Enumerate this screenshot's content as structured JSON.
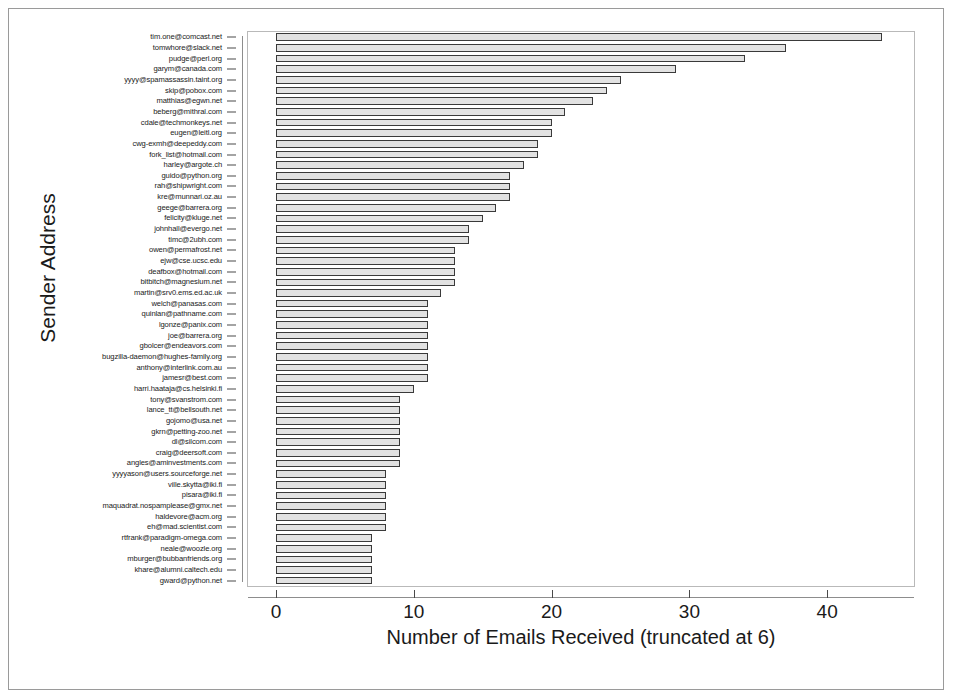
{
  "chart_data": {
    "type": "bar",
    "orientation": "horizontal",
    "title": "",
    "xlabel": "Number of Emails Received (truncated at 6)",
    "ylabel": "Sender Address",
    "xlim": [
      0,
      46
    ],
    "xticks": [
      0,
      10,
      20,
      30,
      40
    ],
    "xtick_labels": [
      "0",
      "10",
      "20",
      "30",
      "40"
    ],
    "grid": false,
    "legend": null,
    "bar_color": "#e2e2e2",
    "bar_edge_color": "#3a3a3a",
    "categories": [
      "tim.one@comcast.net",
      "tomwhore@slack.net",
      "pudge@perl.org",
      "garym@canada.com",
      "yyyy@spamassassin.taint.org",
      "skip@pobox.com",
      "matthias@egwn.net",
      "beberg@mithral.com",
      "cdale@techmonkeys.net",
      "eugen@leitl.org",
      "cwg-exmh@deepeddy.com",
      "fork_list@hotmail.com",
      "harley@argote.ch",
      "guido@python.org",
      "rah@shipwright.com",
      "kre@munnari.oz.au",
      "geege@barrera.org",
      "felicity@kluge.net",
      "johnhall@evergo.net",
      "timc@2ubh.com",
      "owen@permafrost.net",
      "ejw@cse.ucsc.edu",
      "deafbox@hotmail.com",
      "bitbitch@magnesium.net",
      "martin@srv0.ems.ed.ac.uk",
      "welch@panasas.com",
      "quinlan@pathname.com",
      "lgonze@panix.com",
      "joe@barrera.org",
      "gbolcer@endeavors.com",
      "bugzilla-daemon@hughes-family.org",
      "anthony@interlink.com.au",
      "jamesr@best.com",
      "harri.haataja@cs.helsinki.fi",
      "tony@svanstrom.com",
      "lance_tt@bellsouth.net",
      "gojomo@usa.net",
      "gkrn@petting-zoo.net",
      "dl@silcom.com",
      "craig@deersoft.com",
      "angles@aminvestments.com",
      "yyyyason@users.sourceforge.net",
      "ville.skytta@iki.fi",
      "pisara@iki.fi",
      "maquadrat.nospamplease@gmx.net",
      "haldevore@acm.org",
      "eh@mad.scientist.com",
      "rtfrank@paradigm-omega.com",
      "neale@woozle.org",
      "mburger@bubbanfriends.org",
      "khare@alumni.caltech.edu",
      "gward@python.net"
    ],
    "values": [
      44,
      37,
      34,
      29,
      25,
      24,
      23,
      21,
      20,
      20,
      19,
      19,
      18,
      17,
      17,
      17,
      16,
      15,
      14,
      14,
      13,
      13,
      13,
      13,
      12,
      11,
      11,
      11,
      11,
      11,
      11,
      11,
      11,
      10,
      9,
      9,
      9,
      9,
      9,
      9,
      9,
      8,
      8,
      8,
      8,
      8,
      8,
      7,
      7,
      7,
      7,
      7
    ]
  }
}
